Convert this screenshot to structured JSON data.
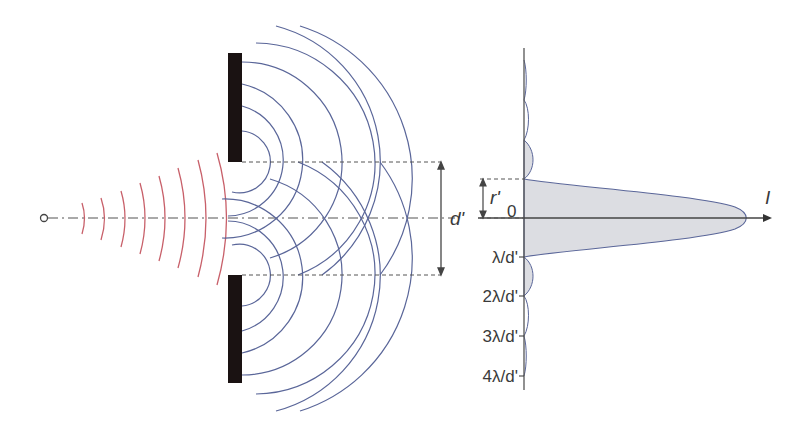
{
  "diagram": {
    "colors": {
      "incident_wave": "#c8606a",
      "diffracted_wave": "#5a6699",
      "barrier": "#1a1212",
      "axis": "#4a4a4a",
      "intensity_fill": "#dcdde2",
      "intensity_outline": "#5a6699",
      "dashed": "#555555"
    },
    "labels": {
      "slit_separation": "d'",
      "fringe_width": "r'",
      "origin": "0",
      "intensity_axis": "I",
      "tick_1": "λ/d'",
      "tick_2": "2λ/d'",
      "tick_3": "3λ/d'",
      "tick_4": "4λ/d'"
    },
    "source": {
      "label": "point source",
      "x": 44,
      "y": 218
    },
    "incident_wavefronts_count": 8,
    "diffracted_wavefronts_per_slit": 7
  }
}
